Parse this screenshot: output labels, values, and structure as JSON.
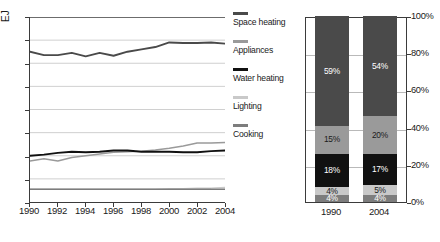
{
  "chart_data": [
    {
      "type": "line",
      "title": "",
      "xlabel": "",
      "ylabel": "EJ",
      "ylim": [
        0,
        16
      ],
      "xlim": [
        1990,
        2004
      ],
      "grid": true,
      "legend_position": "right",
      "x": [
        1990,
        1991,
        1992,
        1993,
        1994,
        1995,
        1996,
        1997,
        1998,
        1999,
        2000,
        2001,
        2002,
        2003,
        2004
      ],
      "ytick_labels": [
        "0",
        "2",
        "4",
        "6",
        "8",
        "10",
        "12",
        "14",
        "16"
      ],
      "xtick_labels": [
        "1990",
        "1992",
        "1994",
        "1996",
        "1998",
        "2000",
        "2002",
        "2004"
      ],
      "series": [
        {
          "name": "Space heating",
          "color": "#4a4a4a",
          "values": [
            13.0,
            12.7,
            12.7,
            12.9,
            12.6,
            12.9,
            12.65,
            13.0,
            13.2,
            13.4,
            13.8,
            13.75,
            13.75,
            13.8,
            13.7
          ]
        },
        {
          "name": "Appliances",
          "color": "#9a9a9a",
          "values": [
            3.55,
            3.75,
            3.55,
            3.85,
            4.0,
            4.15,
            4.3,
            4.35,
            4.4,
            4.5,
            4.65,
            4.85,
            5.1,
            5.1,
            5.15
          ]
        },
        {
          "name": "Water heating",
          "color": "#111111",
          "values": [
            4.0,
            4.1,
            4.25,
            4.35,
            4.3,
            4.35,
            4.45,
            4.45,
            4.35,
            4.35,
            4.35,
            4.3,
            4.3,
            4.4,
            4.45
          ]
        },
        {
          "name": "Lighting",
          "color": "#c9c9c9",
          "values": [
            1.1,
            1.1,
            1.1,
            1.1,
            1.1,
            1.1,
            1.1,
            1.1,
            1.1,
            1.1,
            1.15,
            1.15,
            1.2,
            1.2,
            1.25
          ]
        },
        {
          "name": "Cooking",
          "color": "#7d7d7d",
          "values": [
            1.1,
            1.1,
            1.1,
            1.1,
            1.1,
            1.1,
            1.1,
            1.1,
            1.1,
            1.1,
            1.1,
            1.1,
            1.1,
            1.1,
            1.1
          ]
        }
      ]
    },
    {
      "type": "bar",
      "subtype": "stacked-percent",
      "title": "",
      "xlabel": "",
      "ylabel": "",
      "ylim": [
        0,
        100
      ],
      "grid": true,
      "categories": [
        "1990",
        "2004"
      ],
      "ytick_labels": [
        "0%",
        "20%",
        "40%",
        "60%",
        "80%",
        "100%"
      ],
      "stack_order_bottom_to_top": [
        "Cooking",
        "Lighting",
        "Water heating",
        "Appliances",
        "Space heating"
      ],
      "series": [
        {
          "name": "Cooking",
          "color": "#7d7d7d",
          "text_color": "#ffffff",
          "values": [
            4,
            4
          ],
          "labels": [
            "4%",
            "4%"
          ]
        },
        {
          "name": "Lighting",
          "color": "#c9c9c9",
          "text_color": "#1a1a1a",
          "values": [
            4,
            5
          ],
          "labels": [
            "4%",
            "5%"
          ]
        },
        {
          "name": "Water heating",
          "color": "#111111",
          "text_color": "#ffffff",
          "values": [
            18,
            17
          ],
          "labels": [
            "18%",
            "17%"
          ]
        },
        {
          "name": "Appliances",
          "color": "#9a9a9a",
          "text_color": "#1a1a1a",
          "values": [
            15,
            20
          ],
          "labels": [
            "15%",
            "20%"
          ]
        },
        {
          "name": "Space heating",
          "color": "#4a4a4a",
          "text_color": "#ffffff",
          "values": [
            59,
            54
          ],
          "labels": [
            "59%",
            "54%"
          ]
        }
      ]
    }
  ],
  "line_chart": {
    "unit_label": "EJ",
    "ytick_labels": [
      "16",
      "14",
      "12",
      "10",
      "8",
      "6",
      "4",
      "2",
      "0"
    ],
    "xtick_labels": [
      "1990",
      "1992",
      "1994",
      "1996",
      "1998",
      "2000",
      "2002",
      "2004"
    ]
  },
  "legend": {
    "items": [
      {
        "label": "Space heating",
        "color": "#4a4a4a"
      },
      {
        "label": "Appliances",
        "color": "#9a9a9a"
      },
      {
        "label": "Water heating",
        "color": "#111111"
      },
      {
        "label": "Lighting",
        "color": "#c9c9c9"
      },
      {
        "label": "Cooking",
        "color": "#7d7d7d"
      }
    ]
  },
  "bar_chart": {
    "ytick_labels": [
      "100%",
      "80%",
      "60%",
      "40%",
      "20%",
      "0%"
    ],
    "xtick_labels": [
      "1990",
      "2004"
    ],
    "bars": [
      {
        "category": "1990",
        "segments": [
          {
            "name": "Space heating",
            "value": 59,
            "label": "59%",
            "color": "#4a4a4a",
            "text_color": "#ffffff"
          },
          {
            "name": "Appliances",
            "value": 15,
            "label": "15%",
            "color": "#9a9a9a",
            "text_color": "#1a1a1a"
          },
          {
            "name": "Water heating",
            "value": 18,
            "label": "18%",
            "color": "#111111",
            "text_color": "#ffffff"
          },
          {
            "name": "Lighting",
            "value": 4,
            "label": "4%",
            "color": "#c9c9c9",
            "text_color": "#1a1a1a"
          },
          {
            "name": "Cooking",
            "value": 4,
            "label": "4%",
            "color": "#7d7d7d",
            "text_color": "#ffffff"
          }
        ]
      },
      {
        "category": "2004",
        "segments": [
          {
            "name": "Space heating",
            "value": 54,
            "label": "54%",
            "color": "#4a4a4a",
            "text_color": "#ffffff"
          },
          {
            "name": "Appliances",
            "value": 20,
            "label": "20%",
            "color": "#9a9a9a",
            "text_color": "#1a1a1a"
          },
          {
            "name": "Water heating",
            "value": 17,
            "label": "17%",
            "color": "#111111",
            "text_color": "#ffffff"
          },
          {
            "name": "Lighting",
            "value": 5,
            "label": "5%",
            "color": "#c9c9c9",
            "text_color": "#1a1a1a"
          },
          {
            "name": "Cooking",
            "value": 4,
            "label": "4%",
            "color": "#7d7d7d",
            "text_color": "#ffffff"
          }
        ]
      }
    ]
  }
}
